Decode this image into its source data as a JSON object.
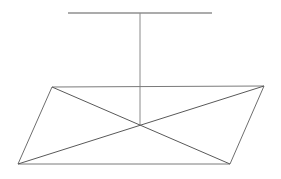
{
  "figure": {
    "canvas": {
      "width": 281,
      "height": 179,
      "background": "#ffffff"
    },
    "colors": {
      "stroke_dark": "#595959",
      "stroke_medium": "#6e6e6e",
      "stroke_light": "#8a8a8a"
    },
    "stroke_width": 1,
    "points": {
      "top_left": {
        "x": 52,
        "y": 87,
        "label": "A"
      },
      "top_right": {
        "x": 264,
        "y": 86,
        "label": "B"
      },
      "bottom_right": {
        "x": 230,
        "y": 164,
        "label": "C"
      },
      "bottom_left": {
        "x": 18,
        "y": 164,
        "label": "D"
      },
      "center": {
        "x": 140,
        "y": 125,
        "label": "O"
      },
      "bar_left": {
        "x": 68,
        "y": 13,
        "label": "E"
      },
      "bar_right": {
        "x": 212,
        "y": 13,
        "label": "F"
      },
      "bar_mid": {
        "x": 140,
        "y": 13,
        "label": "M"
      }
    },
    "elements": {
      "top_bar": {
        "name": "horizontal reference bar",
        "d": "M 68 13 L 212 13",
        "color": "#595959",
        "width": 1.2
      },
      "vertical_axis": {
        "name": "vertical axis line",
        "d": "M 140 13 L 140 125",
        "color": "#8a8a8a",
        "width": 1
      },
      "edge_top": {
        "name": "top edge",
        "d": "M 52 87 L 264 86",
        "color": "#7a7a7a",
        "width": 1
      },
      "edge_right": {
        "name": "right edge",
        "d": "M 264 86 L 230 164",
        "color": "#6e6e6e",
        "width": 1
      },
      "edge_bottom": {
        "name": "bottom edge",
        "d": "M 230 164 L 18 164",
        "color": "#7a7a7a",
        "width": 1
      },
      "edge_left": {
        "name": "left edge",
        "d": "M 18 164 L 52 87",
        "color": "#6e6e6e",
        "width": 1
      },
      "diagonal_a": {
        "name": "diagonal top-left to bottom-right",
        "d": "M 52 87 L 230 164",
        "color": "#595959",
        "width": 1
      },
      "diagonal_b": {
        "name": "diagonal top-right to bottom-left",
        "d": "M 264 86 L 18 164",
        "color": "#595959",
        "width": 1
      }
    }
  }
}
